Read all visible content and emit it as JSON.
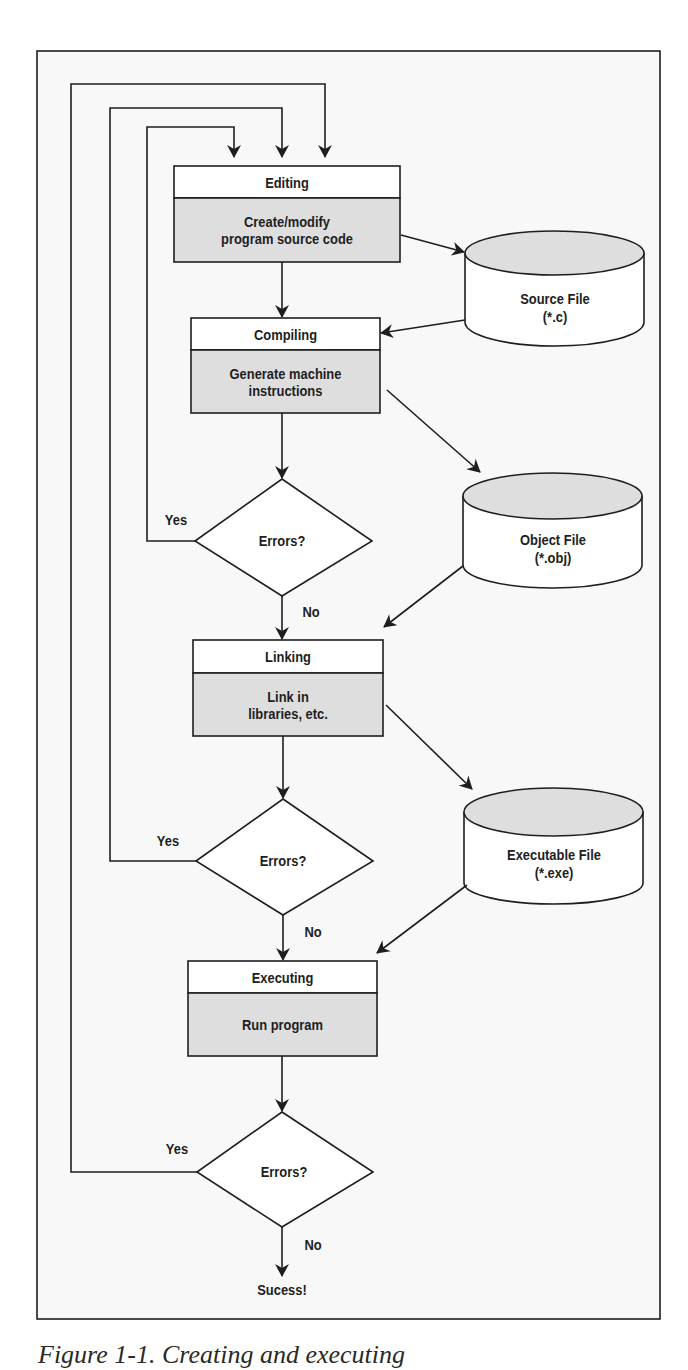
{
  "figure": {
    "caption": "Figure 1-1. Creating and executing",
    "colors": {
      "line": "#1e1e1e",
      "frame_bg": "#f8f8f8",
      "shaded_fill": "#dedede",
      "white_fill": "#ffffff"
    }
  },
  "process_boxes": [
    {
      "id": "editing",
      "title": "Editing",
      "body_lines": [
        "Create/modify",
        "program source code"
      ]
    },
    {
      "id": "compiling",
      "title": "Compiling",
      "body_lines": [
        "Generate machine",
        "instructions"
      ]
    },
    {
      "id": "linking",
      "title": "Linking",
      "body_lines": [
        "Link in",
        "libraries, etc."
      ]
    },
    {
      "id": "executing",
      "title": "Executing",
      "body_lines": [
        "Run program"
      ]
    }
  ],
  "decisions": [
    {
      "id": "compile-errors",
      "text": "Errors?",
      "yes_label": "Yes",
      "no_label": "No"
    },
    {
      "id": "link-errors",
      "text": "Errors?",
      "yes_label": "Yes",
      "no_label": "No"
    },
    {
      "id": "run-errors",
      "text": "Errors?",
      "yes_label": "Yes",
      "no_label": "No"
    }
  ],
  "files": [
    {
      "id": "source-file",
      "name": "Source File",
      "ext": "(*.c)"
    },
    {
      "id": "object-file",
      "name": "Object File",
      "ext": "(*.obj)"
    },
    {
      "id": "executable-file",
      "name": "Executable File",
      "ext": "(*.exe)"
    }
  ],
  "terminal": {
    "text": "Sucess!"
  }
}
